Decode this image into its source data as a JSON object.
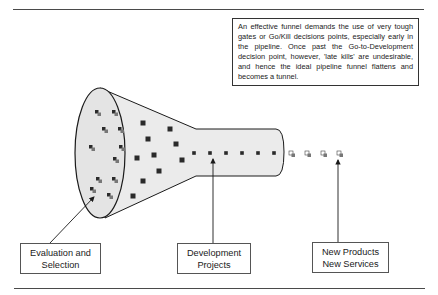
{
  "note": {
    "text": "An effective funnel demands the use of very tough gates or Go/Kill decisions points, especially early in the pipeline. Once past the Go-to-Development decision point, however, 'late kills' are undesirable, and hence the ideal pipeline funnel flattens and becomes a tunnel."
  },
  "labels": {
    "evaluation": {
      "line1": "Evaluation and",
      "line2": "Selection"
    },
    "development": {
      "line1": "Development",
      "line2": "Projects"
    },
    "output": {
      "line1": "New Products",
      "line2": "New Services"
    }
  },
  "colors": {
    "funnel_fill": "#ebebeb",
    "outline": "#1a1a1a",
    "idea_dark": "#2a2a2a",
    "idea_gray": "#777777",
    "rule": "#4a4a4a"
  },
  "elements": {
    "mouth_ideas": [
      [
        98,
        113
      ],
      [
        115,
        113
      ],
      [
        105,
        130
      ],
      [
        121,
        130
      ],
      [
        92,
        148
      ],
      [
        122,
        148
      ],
      [
        116,
        160
      ],
      [
        99,
        180
      ],
      [
        115,
        180
      ],
      [
        93,
        190
      ],
      [
        110,
        196
      ]
    ],
    "cone_projects": [
      [
        143,
        123
      ],
      [
        170,
        129
      ],
      [
        148,
        139
      ],
      [
        176,
        144
      ],
      [
        154,
        155
      ],
      [
        137,
        158
      ],
      [
        182,
        160
      ],
      [
        159,
        171
      ],
      [
        143,
        181
      ],
      [
        133,
        196
      ]
    ],
    "tunnel_projects": [
      [
        194,
        153
      ],
      [
        210,
        153
      ],
      [
        226,
        153
      ],
      [
        242,
        153
      ],
      [
        258,
        153
      ],
      [
        274,
        153
      ]
    ],
    "products": [
      [
        292,
        154
      ],
      [
        308,
        154
      ],
      [
        324,
        154
      ],
      [
        340,
        154
      ]
    ]
  }
}
